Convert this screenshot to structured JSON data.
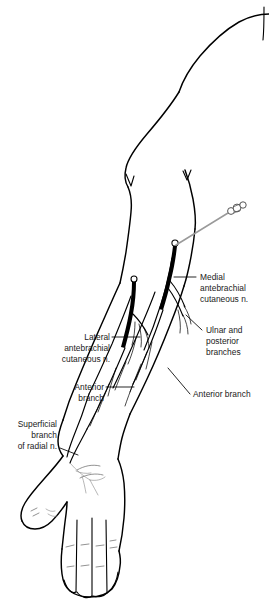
{
  "figure": {
    "domain_description": "Line-drawing anatomical illustration of a right upper limb, anterior view, with labeled cutaneous nerves and an injection needle",
    "background_color": "#ffffff",
    "ink_color": "#000000",
    "needle_color": "#9a9a9a",
    "faint_nerve_color": "#8a8a8a"
  },
  "labels": {
    "medial_antebrachial": {
      "lines": [
        "Medial",
        "antebrachial",
        "cutaneous n."
      ],
      "align": "left"
    },
    "ulnar_posterior": {
      "lines": [
        "Ulnar and",
        "posterior",
        "branches"
      ],
      "align": "left"
    },
    "lateral_antebrachial": {
      "lines": [
        "Lateral",
        "antebrachial",
        "cutaneous n."
      ],
      "align": "right"
    },
    "anterior_branch_left": {
      "lines": [
        "Anterior",
        "branch"
      ],
      "align": "right"
    },
    "anterior_branch_right": {
      "lines": [
        "Anterior branch"
      ],
      "align": "left"
    },
    "superficial_radial": {
      "lines": [
        "Superficial",
        "branch",
        "of radial n."
      ],
      "align": "right"
    }
  },
  "anatomy": {
    "parts": [
      "shoulder",
      "upper-arm",
      "elbow",
      "forearm",
      "wrist",
      "hand",
      "thumb",
      "index-finger",
      "middle-finger",
      "ring-finger",
      "little-finger"
    ]
  },
  "instrument": {
    "name": "injection-needle",
    "parts": [
      "needle-shaft",
      "needle-hub"
    ]
  }
}
